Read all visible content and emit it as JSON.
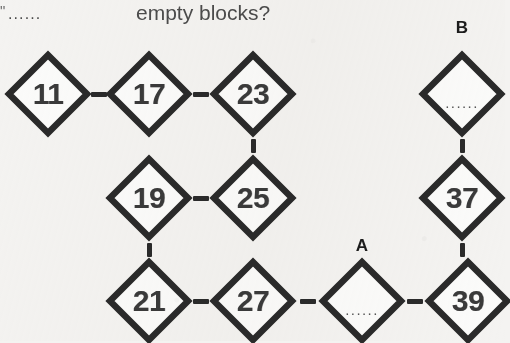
{
  "header": {
    "left_fragment": "\"",
    "left_ellipsis": "......",
    "question_text": "empty blocks?"
  },
  "labels": {
    "a": "A",
    "b": "B"
  },
  "diagram": {
    "empty_marker": "......",
    "nodes": [
      {
        "id": "n11",
        "value": "11",
        "empty": false,
        "cx": 48,
        "cy": 94,
        "r": 42
      },
      {
        "id": "n17",
        "value": "17",
        "empty": false,
        "cx": 149,
        "cy": 94,
        "r": 42
      },
      {
        "id": "n23",
        "value": "23",
        "empty": false,
        "cx": 253,
        "cy": 94,
        "r": 42
      },
      {
        "id": "n19",
        "value": "19",
        "empty": false,
        "cx": 149,
        "cy": 198,
        "r": 42
      },
      {
        "id": "n25",
        "value": "25",
        "empty": false,
        "cx": 253,
        "cy": 198,
        "r": 42
      },
      {
        "id": "n21",
        "value": "21",
        "empty": false,
        "cx": 149,
        "cy": 301,
        "r": 42
      },
      {
        "id": "n27",
        "value": "27",
        "empty": false,
        "cx": 253,
        "cy": 301,
        "r": 42
      },
      {
        "id": "nA",
        "value": "......",
        "empty": true,
        "cx": 362,
        "cy": 301,
        "r": 42
      },
      {
        "id": "n39",
        "value": "39",
        "empty": false,
        "cx": 468,
        "cy": 301,
        "r": 42
      },
      {
        "id": "nB",
        "value": "......",
        "empty": true,
        "cx": 462,
        "cy": 94,
        "r": 42
      },
      {
        "id": "n37",
        "value": "37",
        "empty": false,
        "cx": 462,
        "cy": 198,
        "r": 42
      }
    ],
    "edges": [
      {
        "id": "e11-17",
        "from": "n11",
        "to": "n17",
        "dir": "h"
      },
      {
        "id": "e17-23",
        "from": "n17",
        "to": "n23",
        "dir": "h"
      },
      {
        "id": "e23-25",
        "from": "n23",
        "to": "n25",
        "dir": "v"
      },
      {
        "id": "e19-25",
        "from": "n19",
        "to": "n25",
        "dir": "h"
      },
      {
        "id": "e19-21",
        "from": "n19",
        "to": "n21",
        "dir": "v"
      },
      {
        "id": "e21-27",
        "from": "n21",
        "to": "n27",
        "dir": "h"
      },
      {
        "id": "e27-A",
        "from": "n27",
        "to": "nA",
        "dir": "h"
      },
      {
        "id": "eA-39",
        "from": "nA",
        "to": "n39",
        "dir": "h"
      },
      {
        "id": "eB-37",
        "from": "nB",
        "to": "n37",
        "dir": "v"
      },
      {
        "id": "e37-39",
        "from": "n37",
        "to": "n39",
        "dir": "v"
      }
    ]
  },
  "style": {
    "stroke": "#2a2a2a",
    "fill": "#fbfbfa",
    "background": "#f4f3f1"
  }
}
